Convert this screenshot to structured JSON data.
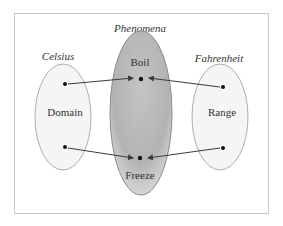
{
  "diagram": {
    "type": "function-mapping",
    "frame": {
      "border_color": "#c8c8c8"
    },
    "sets": [
      {
        "id": "celsius",
        "title": "Celsius",
        "inner_label": "Domain",
        "fill": "#f4f4f4",
        "stroke": "#9a9a9a"
      },
      {
        "id": "phenomena",
        "title": "Phenomena",
        "inner_label_top": "Boil",
        "inner_label_bottom": "Freeze",
        "fill": "#b8b8b8",
        "stroke": "#8a8a8a"
      },
      {
        "id": "fahrenheit",
        "title": "Fahrenheit",
        "inner_label": "Range",
        "fill": "#f4f4f4",
        "stroke": "#9a9a9a"
      }
    ],
    "arrows": [
      {
        "from": "Celsius point (top)",
        "to": "Boil"
      },
      {
        "from": "Fahrenheit point (top)",
        "to": "Boil"
      },
      {
        "from": "Celsius point (bottom)",
        "to": "Freeze"
      },
      {
        "from": "Fahrenheit point (bottom)",
        "to": "Freeze"
      }
    ],
    "colors": {
      "arrow": "#3a3a3a",
      "dot": "#111111",
      "text": "#333333"
    }
  }
}
